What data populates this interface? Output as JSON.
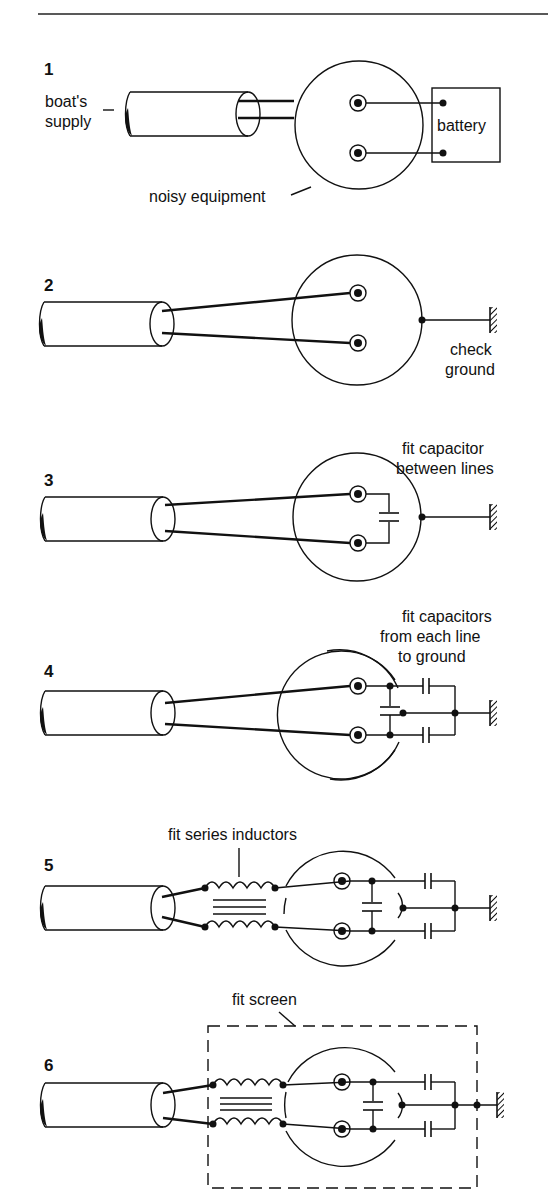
{
  "figure": {
    "steps": [
      {
        "number": "1",
        "labels": {
          "supply": [
            "boat's",
            "supply"
          ],
          "equipment": "noisy equipment",
          "battery": "battery"
        }
      },
      {
        "number": "2",
        "labels": {
          "ground": [
            "check",
            "ground"
          ]
        }
      },
      {
        "number": "3",
        "labels": {
          "note": [
            "fit capacitor",
            "between lines"
          ]
        }
      },
      {
        "number": "4",
        "labels": {
          "note": [
            "fit capacitors",
            "from each line",
            "to ground"
          ]
        }
      },
      {
        "number": "5",
        "labels": {
          "note": "fit series inductors"
        }
      },
      {
        "number": "6",
        "labels": {
          "note": "fit screen"
        }
      }
    ],
    "colors": {
      "ink": "#111111",
      "background": "#ffffff"
    }
  }
}
